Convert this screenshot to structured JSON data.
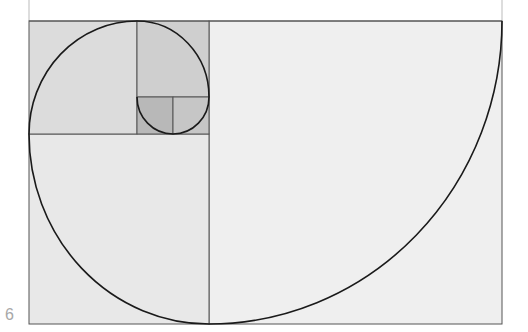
{
  "page": {
    "number": "6"
  },
  "diagram": {
    "colors": {
      "background": "#ffffff",
      "large_square": "#ececec",
      "medium_square": "#dcdcdc",
      "small_square_a": "#d6d6d6",
      "small_square_b": "#c8c8c8",
      "tiny_square_a": "#b6b6b6",
      "tiny_square_b": "#c2c2c2",
      "bottom_square": "#e6e6e6",
      "grid_line": "#555555",
      "spiral": "#1a1a1a"
    }
  }
}
